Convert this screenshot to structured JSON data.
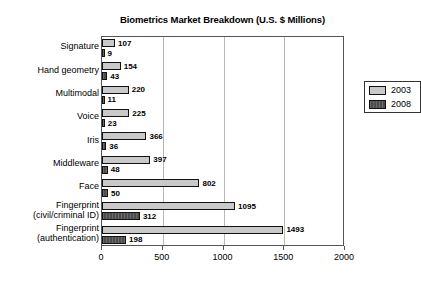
{
  "chart_data": {
    "type": "bar",
    "orientation": "horizontal",
    "title": "Biometrics Market Breakdown (U.S. $ Millions)",
    "xlabel": "",
    "ylabel": "",
    "xlim": [
      0,
      2000
    ],
    "xticks": [
      0,
      500,
      1000,
      1500,
      2000
    ],
    "xtick_labels": [
      "0",
      "500",
      "1000",
      "1500",
      "2000"
    ],
    "grid": true,
    "legend_position": "upper-right",
    "categories": [
      "Signature",
      "Hand geometry",
      "Multimodal",
      "Voice",
      "Iris",
      "Middleware",
      "Face",
      "Fingerprint (civil/criminal ID)",
      "Fingerprint (authentication)"
    ],
    "category_lines": [
      [
        "Signature"
      ],
      [
        "Hand geometry"
      ],
      [
        "Multimodal"
      ],
      [
        "Voice"
      ],
      [
        "Iris"
      ],
      [
        "Middleware"
      ],
      [
        "Face"
      ],
      [
        "Fingerprint",
        "(civil/criminal ID)"
      ],
      [
        "Fingerprint",
        "(authentication)"
      ]
    ],
    "series": [
      {
        "name": "2003",
        "color": "#c9c9c9",
        "values": [
          107,
          154,
          220,
          225,
          366,
          397,
          802,
          1095,
          1493
        ]
      },
      {
        "name": "2008",
        "color": "#4d4d4d",
        "values": [
          9,
          43,
          11,
          23,
          36,
          48,
          50,
          312,
          198
        ]
      }
    ],
    "value_labels": {
      "2003": [
        "107",
        "154",
        "220",
        "225",
        "366",
        "397",
        "802",
        "1095",
        "1493"
      ],
      "2008": [
        "9",
        "43",
        "11",
        "23",
        "36",
        "48",
        "50",
        "312",
        "198"
      ]
    }
  },
  "legend": {
    "entries": [
      {
        "label": "2003",
        "swatch": "light-gray-swatch"
      },
      {
        "label": "2008",
        "swatch": "dark-gray-swatch"
      }
    ]
  }
}
